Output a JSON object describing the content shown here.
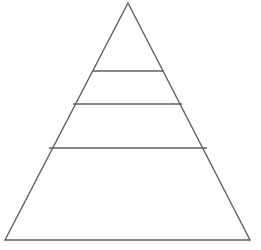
{
  "diagram": {
    "name": "pyramid-diagram",
    "type": "pyramid",
    "title": "",
    "tier_count": 4,
    "background_color": "#ffffff",
    "line_color": "#5f5f5f",
    "fill_color": "#ffffff",
    "line_width": 1.4,
    "canvas": {
      "width": 261,
      "height": 250
    },
    "geometry": {
      "apex": {
        "x": 128,
        "y": 3
      },
      "base_left": {
        "x": 5,
        "y": 240
      },
      "base_right": {
        "x": 250,
        "y": 240
      },
      "divider_lines": [
        {
          "y": 71,
          "x1": 93,
          "x2": 164
        },
        {
          "y": 104,
          "x1": 73,
          "x2": 182
        },
        {
          "y": 148,
          "x1": 49,
          "x2": 207
        }
      ]
    },
    "tiers": [
      {
        "index": 1,
        "label": "",
        "top_y": 3,
        "bottom_y": 71,
        "top_width": 0,
        "bottom_width": 71
      },
      {
        "index": 2,
        "label": "",
        "top_y": 71,
        "bottom_y": 104,
        "top_width": 71,
        "bottom_width": 109
      },
      {
        "index": 3,
        "label": "",
        "top_y": 104,
        "bottom_y": 148,
        "top_width": 109,
        "bottom_width": 158
      },
      {
        "index": 4,
        "label": "",
        "top_y": 148,
        "bottom_y": 240,
        "top_width": 158,
        "bottom_width": 245
      }
    ],
    "outline_points": "128,3 250,240 5,240"
  }
}
